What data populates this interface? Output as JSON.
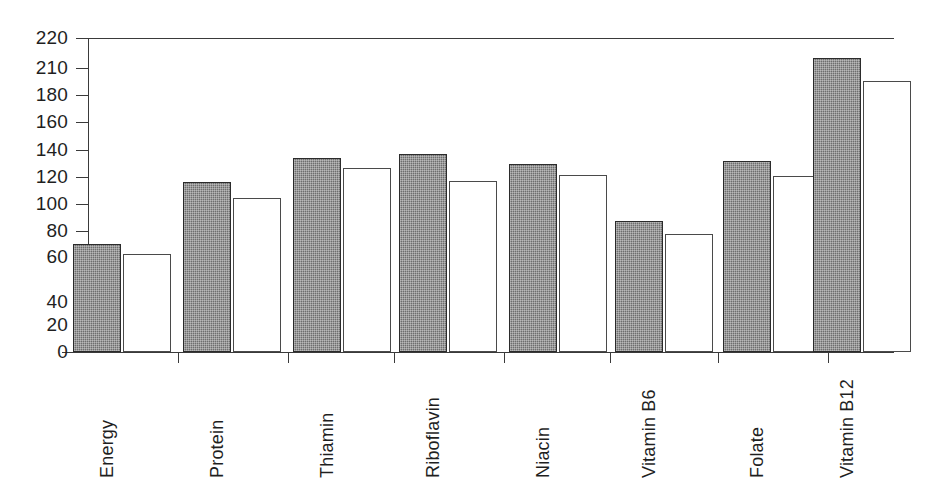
{
  "chart_data": {
    "type": "bar",
    "title": "",
    "subtitle": "",
    "xlabel": "",
    "ylabel": "",
    "categories": [
      "Energy",
      "Protein",
      "Thiamin",
      "Riboflavin",
      "Niacin",
      "Vitamin B6",
      "Folate",
      "Vitamin B12"
    ],
    "series": [
      {
        "name": "dark-series",
        "style": "filled-gray-hatched",
        "values": [
          76,
          119,
          136,
          139,
          132,
          92,
          134,
          206
        ]
      },
      {
        "name": "light-series",
        "style": "white-outlined",
        "values": [
          69,
          108,
          129,
          120,
          124,
          83,
          123,
          190
        ]
      }
    ],
    "ytick_labels": [
      "220",
      "210",
      "180",
      "160",
      "140",
      "120",
      "100",
      "80",
      "60",
      "40",
      "20",
      "0"
    ],
    "ytick_values": [
      220,
      210,
      180,
      160,
      140,
      120,
      100,
      80,
      60,
      40,
      20,
      0
    ],
    "ylim": [
      0,
      220
    ],
    "grid": false,
    "legend": "none",
    "frame": "top-and-left-spines",
    "colors": {
      "dark_bar_fill": "#6e6e6e",
      "dark_bar_edge": "#2b2b2b",
      "light_bar_fill": "#ffffff",
      "light_bar_edge": "#4a4a4a",
      "axis": "#3a3a3a",
      "text": "#1f1f1f",
      "background": "#ffffff"
    }
  },
  "layout": {
    "ytick_y_px": [
      38,
      68,
      95,
      122,
      150,
      177,
      204,
      231,
      257,
      302,
      325,
      352
    ],
    "ytick_y_px_note": "pixel y of each tick, matching scanned spacing",
    "baseline_y_px": 352,
    "group_centers_px": [
      122,
      232,
      342,
      448,
      558,
      664,
      772,
      862
    ],
    "separator_x_px": [
      178,
      288,
      394,
      504,
      610,
      718,
      828
    ],
    "bar_width_px": 48,
    "bar_pair_gap_px": 2
  }
}
